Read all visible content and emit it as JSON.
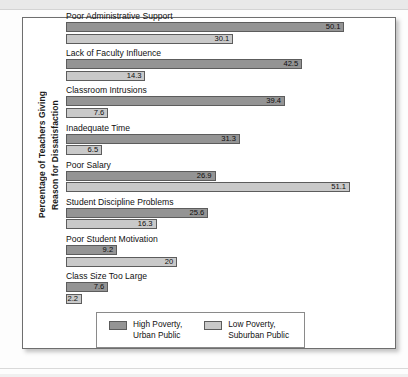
{
  "figure": {
    "ylabel_line1": "Percentage of Teachers Giving",
    "ylabel_line2": "Reason for Dissatisfaction"
  },
  "legend": {
    "items": [
      {
        "name": "high-poverty",
        "line1": "High Poverty,",
        "line2": "Urban Public",
        "color": "#949494"
      },
      {
        "name": "low-poverty",
        "line1": "Low Poverty,",
        "line2": "Suburban Public",
        "color": "#c9c9c9"
      }
    ]
  },
  "chart_data": {
    "type": "bar",
    "title": "",
    "xlabel": "",
    "ylabel": "Percentage of Teachers Giving Reason for Dissatisfaction",
    "orientation": "horizontal",
    "xlim": [
      0,
      51.1
    ],
    "grid": false,
    "legend_position": "bottom",
    "categories": [
      "Poor Administrative Support",
      "Lack of Faculty Influence",
      "Classroom Intrusions",
      "Inadequate Time",
      "Poor Salary",
      "Student Discipline Problems",
      "Poor Student Motivation",
      "Class Size Too Large"
    ],
    "series": [
      {
        "name": "High Poverty, Urban Public",
        "color": "#949494",
        "values": [
          50.1,
          42.5,
          39.4,
          31.3,
          26.9,
          25.6,
          9.2,
          7.6
        ],
        "labels": [
          "50.1",
          "42.5",
          "39.4",
          "31.3",
          "26.9",
          "25.6",
          "9.2",
          "7.6"
        ]
      },
      {
        "name": "Low Poverty, Suburban Public",
        "color": "#c9c9c9",
        "values": [
          30.1,
          14.3,
          7.6,
          6.5,
          51.1,
          16.3,
          20,
          2.2
        ],
        "labels": [
          "30.1",
          "14.3",
          "7.6",
          "6.5",
          "51.1",
          "16.3",
          "20",
          "2.2"
        ]
      }
    ]
  }
}
